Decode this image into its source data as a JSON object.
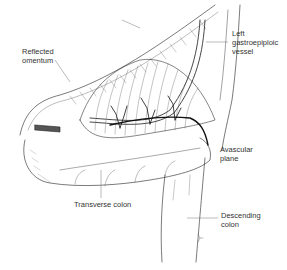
{
  "figure": {
    "type": "anatomical-illustration",
    "line_color": "#222222",
    "leader_color": "#777777",
    "background": "#ffffff"
  },
  "labels": {
    "reflected_omentum": {
      "line1": "Reflected",
      "line2": "omentum"
    },
    "left_gastroepiploic_vessel": {
      "line1": "Left",
      "line2": "gastroepiploic",
      "line3": "vessel"
    },
    "avascular_plane": {
      "line1": "Avascular",
      "line2": "plane"
    },
    "transverse_colon": {
      "line1": "Transverse colon"
    },
    "descending_colon": {
      "line1": "Descending",
      "line2": "colon"
    }
  }
}
